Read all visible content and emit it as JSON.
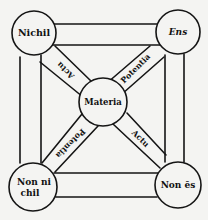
{
  "diagram": {
    "type": "square-of-opposition",
    "nodes": {
      "top_left": {
        "label": "Nichil",
        "cx": 34,
        "cy": 33,
        "r": 22
      },
      "top_right": {
        "label": "Ens",
        "cx": 178,
        "cy": 32,
        "r": 22
      },
      "center": {
        "label": "Materia",
        "cx": 103,
        "cy": 102,
        "r": 24
      },
      "bottom_left": {
        "label_line1": "Non ni",
        "label_line2": "chil",
        "cx": 33,
        "cy": 187,
        "r": 24
      },
      "bottom_right": {
        "label": "Non ēs",
        "cx": 178,
        "cy": 185,
        "r": 23
      }
    },
    "bands": {
      "upper_left": {
        "label": "Actu"
      },
      "upper_right": {
        "label": "Potentia"
      },
      "lower_left": {
        "label": "Potentia"
      },
      "lower_right": {
        "label": "Actu"
      }
    },
    "colors": {
      "ink": "#151515",
      "paper": "#f4f4f2"
    }
  }
}
